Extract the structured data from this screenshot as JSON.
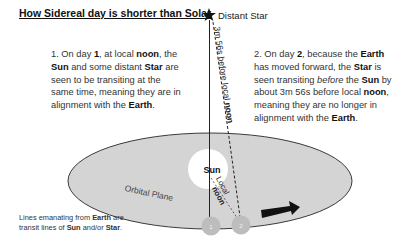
{
  "title": "How Sidereal day is shorter than Solar",
  "star": {
    "icon": "star-icon",
    "label": "Distant Star"
  },
  "paragraph1": {
    "parts": [
      "1. On day ",
      "1",
      ", at local ",
      "noon",
      ", the ",
      "Sun",
      " and some distant ",
      "Star",
      " are seen to be transiting at the same time, meaning they are in alignment with the ",
      "Earth",
      "."
    ]
  },
  "paragraph2": {
    "parts": [
      "2. On day ",
      "2",
      ", because the ",
      "Earth",
      " has moved forward, the ",
      "Star",
      " is seen transiting ",
      "before",
      " the ",
      "Sun",
      " by about 3m 56s before local ",
      "noon",
      ", meaning they are no longer in alignment with the ",
      "Earth",
      "."
    ]
  },
  "labels": {
    "dashed_line": "3m 56s before local ",
    "dashed_line_bold": "noon",
    "sun": "Sun",
    "local": "Local",
    "noon": "noon",
    "orbital_plane": "Orbital Plane",
    "earth1": "1",
    "earth2": "2"
  },
  "footnote": {
    "parts": [
      "Lines emanating from ",
      "Earth",
      " are transit lines of ",
      "Sun",
      " and/or ",
      "Star",
      "."
    ]
  },
  "colors": {
    "orbit_fill": "#d4d4d4",
    "orbit_stroke": "#3a3a3a",
    "sun": "#ffffff",
    "earth": "#bdbdbd",
    "arrow": "#111111"
  }
}
